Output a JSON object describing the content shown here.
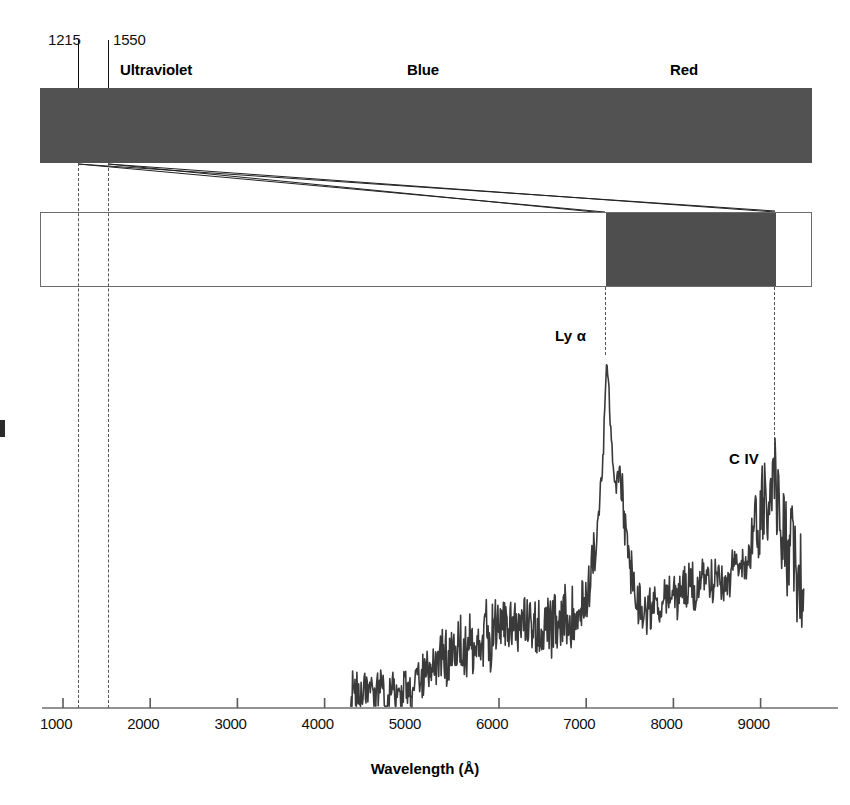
{
  "figure": {
    "background_color": "#ffffff",
    "bar_color": "#525252",
    "highlight_color": "#4e4e4e",
    "trace_color": "#3a3a3a"
  },
  "rest_frame": {
    "tick_labels": [
      "1215",
      "1550"
    ],
    "tick_values": [
      1215,
      1550
    ],
    "band_captions": [
      "Ultraviolet",
      "Blue",
      "Red"
    ]
  },
  "observed_frame": {
    "highlight_range_label": [
      "7230",
      "9150"
    ]
  },
  "annotations": {
    "lyman_alpha": "Ly α",
    "c_iv": "C IV"
  },
  "axis": {
    "xlabel": "Wavelength (Å)",
    "ticks": [
      "1000",
      "2000",
      "3000",
      "4000",
      "5000",
      "6000",
      "7000",
      "8000",
      "9000"
    ]
  },
  "chart_data": {
    "type": "line",
    "title": "",
    "xlabel": "Wavelength (Å)",
    "ylabel": "",
    "xlim": [
      700,
      9600
    ],
    "ylim": [
      0,
      1
    ],
    "grid": false,
    "legend": null,
    "ticks": [
      1000,
      2000,
      3000,
      4000,
      5000,
      6000,
      7000,
      8000,
      9000
    ],
    "annotations": [
      {
        "label": "Ly α",
        "x": 7230,
        "y": 0.98
      },
      {
        "label": "C IV",
        "x": 9150,
        "y": 0.66
      }
    ],
    "vertical_markers": [
      {
        "x": 1215,
        "label": "1215",
        "style": "solid"
      },
      {
        "x": 1550,
        "label": "1550",
        "style": "solid"
      },
      {
        "x": 7230,
        "label": "",
        "style": "dashed"
      },
      {
        "x": 9150,
        "label": "",
        "style": "dashed"
      }
    ],
    "series": [
      {
        "name": "Quasar flux",
        "x": [
          4300,
          4350,
          4400,
          4450,
          4500,
          4550,
          4600,
          4650,
          4700,
          4750,
          4800,
          4850,
          4900,
          4950,
          5000,
          5050,
          5100,
          5150,
          5200,
          5250,
          5300,
          5350,
          5400,
          5450,
          5500,
          5550,
          5600,
          5650,
          5700,
          5750,
          5800,
          5850,
          5900,
          5950,
          6000,
          6050,
          6100,
          6150,
          6200,
          6250,
          6300,
          6350,
          6400,
          6450,
          6500,
          6550,
          6600,
          6650,
          6700,
          6750,
          6800,
          6850,
          6900,
          6950,
          7000,
          7050,
          7100,
          7150,
          7200,
          7230,
          7260,
          7300,
          7340,
          7380,
          7420,
          7460,
          7500,
          7550,
          7600,
          7650,
          7700,
          7750,
          7800,
          7850,
          7900,
          7950,
          8000,
          8050,
          8100,
          8150,
          8200,
          8250,
          8300,
          8350,
          8400,
          8450,
          8500,
          8550,
          8600,
          8650,
          8700,
          8750,
          8800,
          8850,
          8900,
          8950,
          9000,
          9050,
          9100,
          9150,
          9200,
          9250,
          9300,
          9350,
          9400,
          9450,
          9500
        ],
        "y": [
          0.02,
          0.06,
          0.03,
          0.05,
          0.03,
          0.04,
          0.03,
          0.05,
          0.03,
          0.04,
          0.03,
          0.05,
          0.04,
          0.06,
          0.05,
          0.09,
          0.07,
          0.1,
          0.08,
          0.14,
          0.12,
          0.15,
          0.13,
          0.16,
          0.14,
          0.17,
          0.15,
          0.19,
          0.16,
          0.2,
          0.18,
          0.22,
          0.19,
          0.24,
          0.21,
          0.26,
          0.22,
          0.27,
          0.23,
          0.25,
          0.22,
          0.26,
          0.21,
          0.24,
          0.2,
          0.25,
          0.21,
          0.23,
          0.2,
          0.26,
          0.22,
          0.28,
          0.25,
          0.32,
          0.3,
          0.38,
          0.42,
          0.55,
          0.74,
          0.98,
          0.88,
          0.72,
          0.62,
          0.66,
          0.58,
          0.48,
          0.4,
          0.33,
          0.3,
          0.28,
          0.27,
          0.28,
          0.3,
          0.29,
          0.32,
          0.3,
          0.33,
          0.31,
          0.34,
          0.32,
          0.35,
          0.33,
          0.36,
          0.34,
          0.37,
          0.35,
          0.38,
          0.36,
          0.39,
          0.37,
          0.4,
          0.38,
          0.43,
          0.41,
          0.48,
          0.52,
          0.56,
          0.6,
          0.63,
          0.66,
          0.58,
          0.5,
          0.44,
          0.47,
          0.4,
          0.36,
          0.3
        ]
      }
    ]
  }
}
